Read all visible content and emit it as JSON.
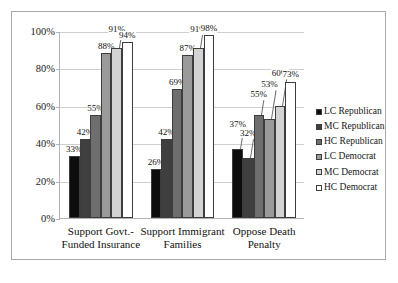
{
  "chart_data": {
    "type": "bar",
    "title": "",
    "subtitle": "",
    "xlabel": "",
    "ylabel": "",
    "ylim": [
      0,
      100
    ],
    "ytick_labels": [
      "0%",
      "20%",
      "40%",
      "60%",
      "80%",
      "100%"
    ],
    "ytick_values": [
      0,
      20,
      40,
      60,
      80,
      100
    ],
    "grid": true,
    "legend_position": "right",
    "categories": [
      "Support Govt.-Funded Insurance",
      "Support Immigrant Families",
      "Oppose Death Penalty"
    ],
    "category_lines": [
      [
        "Support Govt.-",
        "Funded Insurance"
      ],
      [
        "Support Immigrant",
        "Families"
      ],
      [
        "Oppose Death",
        "Penalty"
      ]
    ],
    "series": [
      {
        "name": "LC Republican",
        "color": "#0d0d0d",
        "values": [
          33,
          26,
          37
        ],
        "labels": [
          "33%",
          "26%",
          "37%"
        ]
      },
      {
        "name": "MC Republican",
        "color": "#3f3f3f",
        "values": [
          42,
          42,
          32
        ],
        "labels": [
          "42%",
          "42%",
          "32%"
        ]
      },
      {
        "name": "HC Republican",
        "color": "#6e6e6e",
        "values": [
          55,
          69,
          55
        ],
        "labels": [
          "55%",
          "69%",
          "55%"
        ]
      },
      {
        "name": "LC Democrat",
        "color": "#9a9a9a",
        "values": [
          88,
          87,
          53
        ],
        "labels": [
          "88%",
          "87%",
          "53%"
        ]
      },
      {
        "name": "MC Democrat",
        "color": "#d3d3d3",
        "values": [
          91,
          91,
          60
        ],
        "labels": [
          "91%",
          "91%",
          "60%"
        ]
      },
      {
        "name": "HC Democrat",
        "color": "#ffffff",
        "values": [
          94,
          98,
          73
        ],
        "labels": [
          "94%",
          "98%",
          "73%"
        ]
      }
    ]
  },
  "legend": {
    "items": [
      {
        "label": "LC Republican",
        "color": "#0d0d0d"
      },
      {
        "label": "MC Republican",
        "color": "#3f3f3f"
      },
      {
        "label": "HC Republican",
        "color": "#6e6e6e"
      },
      {
        "label": "LC Democrat",
        "color": "#9a9a9a"
      },
      {
        "label": "MC Democrat",
        "color": "#d3d3d3"
      },
      {
        "label": "HC Democrat",
        "color": "#ffffff"
      }
    ]
  },
  "caption": {
    "text": ""
  }
}
